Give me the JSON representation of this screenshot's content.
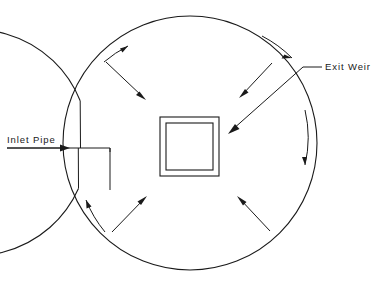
{
  "diagram": {
    "background_color": "#ffffff",
    "line_color": "#1a1a1a",
    "labels": {
      "inlet_pipe": "Inlet Pipe",
      "exit_weir": "Exit  Weir"
    },
    "geometry": {
      "center_x": 190,
      "center_y": 143,
      "outer_radius": 127,
      "inner_radius": 113,
      "weir_outer": {
        "x": 160,
        "y": 117,
        "width": 59,
        "height": 59
      },
      "weir_inner": {
        "x": 166,
        "y": 123,
        "width": 47,
        "height": 47
      }
    },
    "annotations": {
      "flow_direction": "clockwise",
      "radial_direction": "inward",
      "flow_arrow_count": 4,
      "radial_arrow_count": 4
    },
    "icons": {
      "inlet_arrow": "arrow-right-icon",
      "weir_leader_arrow": "arrow-pointer-icon"
    }
  }
}
